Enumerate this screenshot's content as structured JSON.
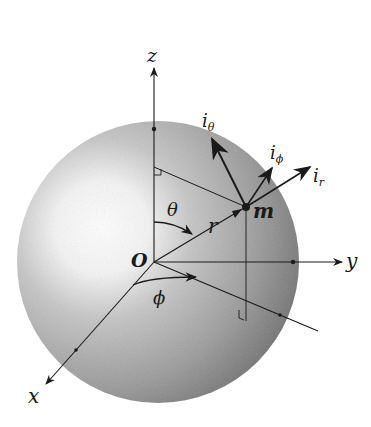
{
  "diagram": {
    "colors": {
      "ink": "#1a1a1a",
      "sphere_dark": "#6e6e6e",
      "sphere_mid": "#a8a8a8",
      "highlight": "#ffffff",
      "background": "#ffffff"
    },
    "origin": {
      "label": "O"
    },
    "axes": [
      {
        "id": "z",
        "label": "z"
      },
      {
        "id": "y",
        "label": "y"
      },
      {
        "id": "x",
        "label": "x"
      }
    ],
    "point": {
      "label": "m"
    },
    "radius_vector": {
      "label": "r"
    },
    "angles": [
      {
        "id": "theta",
        "label": "θ"
      },
      {
        "id": "phi",
        "label": "ϕ"
      }
    ],
    "unit_vectors": [
      {
        "id": "i_theta",
        "base": "i",
        "subscript": "θ"
      },
      {
        "id": "i_phi",
        "base": "i",
        "subscript": "ϕ"
      },
      {
        "id": "i_r",
        "base": "i",
        "subscript": "r"
      }
    ]
  }
}
